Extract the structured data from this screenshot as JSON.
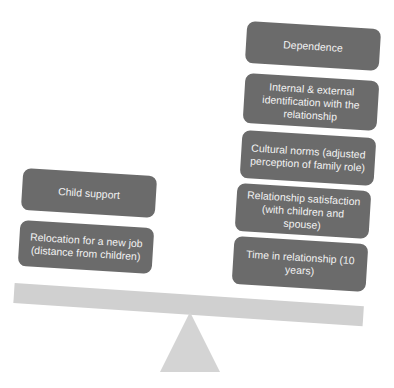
{
  "diagram": {
    "type": "balance-scale",
    "left_side": {
      "items": [
        {
          "label": "Child support"
        },
        {
          "label": "Relocation for a new job (distance from children)"
        }
      ]
    },
    "right_side": {
      "items": [
        {
          "label": "Dependence"
        },
        {
          "label": "Internal & external identification with the relationship"
        },
        {
          "label": "Cultural norms (adjusted perception of family role)"
        },
        {
          "label": "Relationship satisfaction (with children and spouse)"
        },
        {
          "label": "Time in relationship (10 years)"
        }
      ]
    },
    "colors": {
      "box_fill": "#6b6b6b",
      "box_text": "#f2f2f2",
      "beam": "#d0d0d0",
      "fulcrum": "#d4d4d4",
      "background": "#ffffff"
    }
  }
}
